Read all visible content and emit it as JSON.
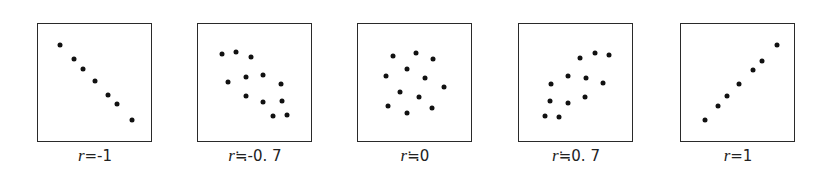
{
  "chart_data": {
    "type": "scatter",
    "title": "",
    "xlabel": "",
    "ylabel": "",
    "grid": false,
    "axes_visible": false,
    "panels": [
      {
        "label_var": "r",
        "label_op": "=",
        "label_value": "-1",
        "left": 37,
        "points": [
          [
            22,
            21
          ],
          [
            36,
            35
          ],
          [
            45,
            45
          ],
          [
            57,
            57
          ],
          [
            70,
            71
          ],
          [
            79,
            80
          ],
          [
            94,
            96
          ]
        ]
      },
      {
        "label_var": "r",
        "label_op": "≒",
        "label_value": "-0. 7",
        "left": 197,
        "points": [
          [
            24,
            30
          ],
          [
            38,
            28
          ],
          [
            53,
            33
          ],
          [
            30,
            58
          ],
          [
            48,
            53
          ],
          [
            65,
            51
          ],
          [
            83,
            60
          ],
          [
            48,
            72
          ],
          [
            65,
            78
          ],
          [
            84,
            77
          ],
          [
            75,
            92
          ],
          [
            89,
            91
          ]
        ]
      },
      {
        "label_var": "r",
        "label_op": "≒",
        "label_value": "0",
        "left": 357,
        "points": [
          [
            35,
            32
          ],
          [
            58,
            29
          ],
          [
            75,
            35
          ],
          [
            49,
            45
          ],
          [
            28,
            52
          ],
          [
            67,
            54
          ],
          [
            86,
            63
          ],
          [
            42,
            68
          ],
          [
            61,
            73
          ],
          [
            30,
            82
          ],
          [
            74,
            84
          ],
          [
            49,
            89
          ]
        ]
      },
      {
        "label_var": "r",
        "label_op": "≒",
        "label_value": "0. 7",
        "left": 518,
        "points": [
          [
            61,
            34
          ],
          [
            76,
            29
          ],
          [
            90,
            31
          ],
          [
            49,
            52
          ],
          [
            67,
            54
          ],
          [
            84,
            59
          ],
          [
            32,
            60
          ],
          [
            66,
            73
          ],
          [
            31,
            77
          ],
          [
            49,
            79
          ],
          [
            26,
            92
          ],
          [
            40,
            93
          ]
        ]
      },
      {
        "label_var": "r",
        "label_op": "=",
        "label_value": "1",
        "left": 680,
        "points": [
          [
            96,
            21
          ],
          [
            81,
            37
          ],
          [
            72,
            46
          ],
          [
            58,
            60
          ],
          [
            46,
            72
          ],
          [
            37,
            82
          ],
          [
            24,
            96
          ]
        ]
      }
    ]
  }
}
